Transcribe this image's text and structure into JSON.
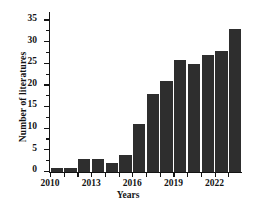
{
  "chart_data": {
    "type": "bar",
    "title": "",
    "xlabel": "Years",
    "ylabel": "Number of literatures",
    "categories": [
      "2010",
      "2011",
      "2012",
      "2013",
      "2014",
      "2015",
      "2016",
      "2017",
      "2018",
      "2019",
      "2020",
      "2021",
      "2022",
      "2023"
    ],
    "values": [
      1,
      1,
      3,
      3,
      2,
      4,
      11,
      18,
      21,
      26,
      25,
      27,
      28,
      33
    ],
    "xtick_labels": [
      "2010",
      "2013",
      "2016",
      "2019",
      "2022"
    ],
    "xtick_categories": [
      "2010",
      "2013",
      "2016",
      "2019",
      "2022"
    ],
    "ytick_labels": [
      "0",
      "5",
      "10",
      "15",
      "20",
      "25",
      "30",
      "35"
    ],
    "ytick_values": [
      0,
      5,
      10,
      15,
      20,
      25,
      30,
      35
    ],
    "ylim": [
      0,
      37
    ],
    "grid": false,
    "legend": false,
    "legend_position": "none",
    "bar_color": "#2e2e2e",
    "axis_color": "#141414",
    "background": "#ffffff"
  }
}
